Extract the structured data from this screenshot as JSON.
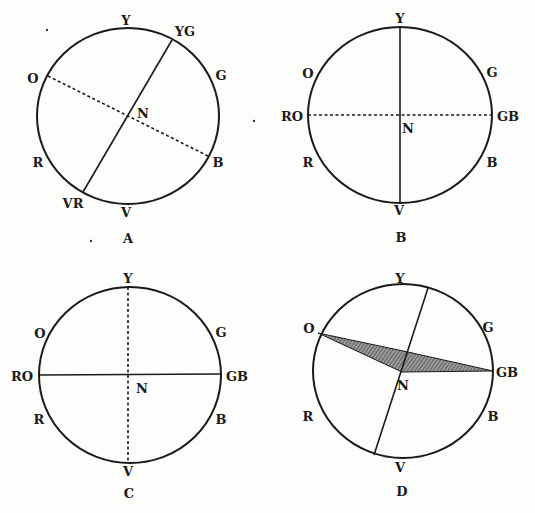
{
  "figures": [
    {
      "id": "A",
      "caption": "A",
      "labels": {
        "Y": "Y",
        "YG": "YG",
        "G": "G",
        "O": "O",
        "N": "N",
        "R": "R",
        "B": "B",
        "VR": "VR",
        "V": "V"
      },
      "lines": [
        {
          "from": "YG",
          "to": "VR",
          "style": "solid"
        },
        {
          "from": "O",
          "to": "B",
          "style": "dashed"
        }
      ]
    },
    {
      "id": "B",
      "caption": "B",
      "labels": {
        "Y": "Y",
        "O": "O",
        "G": "G",
        "RO": "RO",
        "GB": "GB",
        "N": "N",
        "R": "R",
        "B": "B",
        "V": "V"
      },
      "lines": [
        {
          "from": "Y",
          "to": "V",
          "style": "solid"
        },
        {
          "from": "RO",
          "to": "GB",
          "style": "dashed"
        }
      ]
    },
    {
      "id": "C",
      "caption": "C",
      "labels": {
        "Y": "Y",
        "O": "O",
        "G": "G",
        "RO": "RO",
        "GB": "GB",
        "N": "N",
        "R": "R",
        "B": "B",
        "V": "V"
      },
      "lines": [
        {
          "from": "Y",
          "to": "V",
          "style": "dashed"
        },
        {
          "from": "RO",
          "to": "GB",
          "style": "solid"
        }
      ]
    },
    {
      "id": "D",
      "caption": "D",
      "labels": {
        "Y": "Y",
        "O": "O",
        "G": "G",
        "GB": "GB",
        "N": "N",
        "R": "R",
        "B": "B",
        "V": "V"
      },
      "lines": [
        {
          "from": "top",
          "to": "bottom",
          "style": "solid"
        }
      ],
      "shaded_region": {
        "from": "O",
        "to": "GB",
        "fill": "hatched"
      }
    }
  ],
  "colors": {
    "ink": "#1a1a1a",
    "paper": "#fdfdfc",
    "shade": "#7a7a7a"
  }
}
